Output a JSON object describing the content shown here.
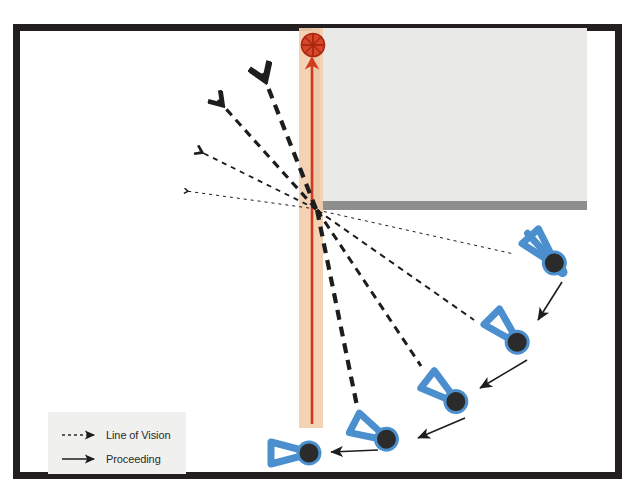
{
  "figure": {
    "background_color": "#ffffff",
    "frame": {
      "name": "photo-frame-border",
      "color": "#231f20",
      "x": 13,
      "y": 24,
      "width": 609,
      "height": 455,
      "stroke_width": 7
    }
  },
  "legend": {
    "name": "legend-box",
    "background_color": "#f0f0ee",
    "x": 48,
    "y": 412,
    "width": 138,
    "height": 62,
    "entries": [
      {
        "id": "line-of-vision",
        "label": "Line of Vision",
        "style": "dashed-arrow",
        "color": "#2a2a2a"
      },
      {
        "id": "proceeding",
        "label": "Proceeding",
        "style": "solid-arrow",
        "color": "#2a2a2a"
      }
    ]
  },
  "building": {
    "name": "building-block",
    "fill": "#e9e9e7",
    "x": 319,
    "y": 28,
    "width": 268,
    "height": 178,
    "left_edge_color": "#8e8e8e",
    "bottom_edge_color": "#8e8e8e",
    "corner_point": {
      "x": 316,
      "y": 209
    }
  },
  "corridor": {
    "name": "corridor-band",
    "fill": "#f3ceae",
    "x": 299,
    "y": 28,
    "width": 24,
    "height": 400
  },
  "path_arrow": {
    "name": "red-path-arrow",
    "color": "#d03a20",
    "from": {
      "x": 312,
      "y": 420
    },
    "to": {
      "x": 312,
      "y": 56
    },
    "description": "red directional path running up the corridor"
  },
  "target_marker": {
    "name": "crosshair-target-marker",
    "color": "#d03a20",
    "cx": 313,
    "cy": 45,
    "r": 12,
    "description": "red circle with crosshair"
  },
  "vision_lines_upper": {
    "name": "vision-lines-upper-fan",
    "description": "Four dashed lines of vision fanning up-left from the corner, each ending in a chevron arrowhead. Weight decreases from thick to hairline.",
    "origin": {
      "x": 316,
      "y": 209
    },
    "lines": [
      {
        "id": "lov-u1",
        "to": {
          "x": 262,
          "y": 72
        },
        "dash": "10 7",
        "width": 4.2
      },
      {
        "id": "lov-u2",
        "to": {
          "x": 218,
          "y": 100
        },
        "dash": "8 6",
        "width": 3.2
      },
      {
        "id": "lov-u3",
        "to": {
          "x": 199,
          "y": 151
        },
        "dash": "5 5",
        "width": 1.8
      },
      {
        "id": "lov-u4",
        "to": {
          "x": 186,
          "y": 191
        },
        "dash": "3 4",
        "width": 1.0
      }
    ]
  },
  "vision_lines_lower": {
    "name": "vision-lines-lower-fan",
    "description": "Four dashed lines of vision from each pedestrian up to the building corner.",
    "origin": {
      "x": 316,
      "y": 209
    },
    "lines": [
      {
        "id": "lov-l1",
        "to": {
          "x": 512,
          "y": 253
        },
        "dash": "3 4",
        "width": 1.0
      },
      {
        "id": "lov-l2",
        "to": {
          "x": 472,
          "y": 318
        },
        "dash": "6 5",
        "width": 2.0
      },
      {
        "id": "lov-l3",
        "to": {
          "x": 420,
          "y": 364
        },
        "dash": "8 6",
        "width": 3.0
      },
      {
        "id": "lov-l4",
        "to": {
          "x": 356,
          "y": 404
        },
        "dash": "10 7",
        "width": 4.2
      }
    ]
  },
  "pedestrians": [
    {
      "id": "pedestrian-1",
      "name": "pedestrian-figure-1",
      "head": {
        "cx": 557,
        "cy": 266
      },
      "heading_deg": 228,
      "body_color": "#4b8fcf",
      "head_color": "#2b2b2b"
    },
    {
      "id": "pedestrian-2",
      "name": "pedestrian-figure-2",
      "head": {
        "cx": 520,
        "cy": 345
      },
      "heading_deg": 225,
      "body_color": "#4b8fcf",
      "head_color": "#2b2b2b"
    },
    {
      "id": "pedestrian-3",
      "name": "pedestrian-figure-3",
      "head": {
        "cx": 459,
        "cy": 404
      },
      "heading_deg": 218,
      "body_color": "#4b8fcf",
      "head_color": "#2b2b2b"
    },
    {
      "id": "pedestrian-4",
      "name": "pedestrian-figure-4",
      "head": {
        "cx": 390,
        "cy": 441
      },
      "heading_deg": 207,
      "body_color": "#4b8fcf",
      "head_color": "#2b2b2b"
    },
    {
      "id": "pedestrian-5",
      "name": "pedestrian-figure-5",
      "head": {
        "cx": 313,
        "cy": 453
      },
      "heading_deg": 180,
      "body_color": "#4b8fcf",
      "head_color": "#2b2b2b"
    }
  ],
  "proceeding_arrows": [
    {
      "id": "proc-1",
      "name": "proceeding-arrow-1",
      "from": {
        "x": 562,
        "y": 282
      },
      "to": {
        "x": 540,
        "y": 320
      }
    },
    {
      "id": "proc-2",
      "name": "proceeding-arrow-2",
      "from": {
        "x": 525,
        "y": 360
      },
      "to": {
        "x": 481,
        "y": 387
      }
    },
    {
      "id": "proc-3",
      "name": "proceeding-arrow-3",
      "from": {
        "x": 463,
        "y": 418
      },
      "to": {
        "x": 419,
        "y": 437
      }
    },
    {
      "id": "proc-4",
      "name": "proceeding-arrow-4",
      "from": {
        "x": 377,
        "y": 449
      },
      "to": {
        "x": 333,
        "y": 452
      }
    }
  ]
}
